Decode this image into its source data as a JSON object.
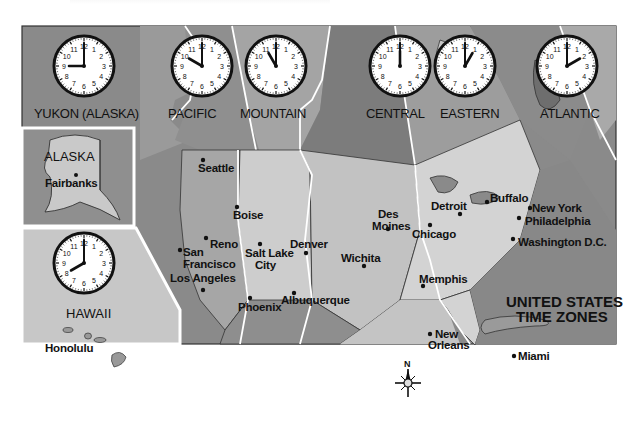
{
  "map": {
    "title_line1": "UNITED STATES",
    "title_line2": "TIME ZONES",
    "compass_label": "N",
    "colors": {
      "frame": "#333333",
      "ocean_dark": "#8a8a8a",
      "zone_dark": "#7c7c7c",
      "zone_mid": "#9e9e9e",
      "land_light": "#c9c9c9",
      "land_lighter": "#d9d9d9",
      "gulf": "#c4c4c4",
      "boundary": "#ffffff",
      "clock_face": "#ffffff",
      "clock_rim": "#111111"
    }
  },
  "clocks": [
    {
      "zone": "YUKON (ALASKA)",
      "time": "9:00",
      "hour": 9,
      "minute": 0
    },
    {
      "zone": "PACIFIC",
      "time": "10:00",
      "hour": 10,
      "minute": 0
    },
    {
      "zone": "MOUNTAIN",
      "time": "11:00",
      "hour": 11,
      "minute": 0
    },
    {
      "zone": "CENTRAL",
      "time": "12:00",
      "hour": 12,
      "minute": 0
    },
    {
      "zone": "EASTERN",
      "time": "1:00",
      "hour": 1,
      "minute": 0
    },
    {
      "zone": "ATLANTIC",
      "time": "2:00",
      "hour": 2,
      "minute": 0
    }
  ],
  "insets": {
    "alaska": {
      "label": "ALASKA",
      "city": "Fairbanks"
    },
    "hawaii": {
      "label": "HAWAII",
      "city": "Honolulu",
      "clock": {
        "time": "8:00",
        "hour": 8,
        "minute": 0
      }
    }
  },
  "cities": [
    {
      "name": "Seattle"
    },
    {
      "name": "Boise"
    },
    {
      "name": "Reno"
    },
    {
      "name": "San Francisco",
      "line1": "San",
      "line2": "Francisco"
    },
    {
      "name": "Los Angeles"
    },
    {
      "name": "Salt Lake City",
      "line1": "Salt Lake",
      "line2": "City"
    },
    {
      "name": "Denver"
    },
    {
      "name": "Phoenix"
    },
    {
      "name": "Albuquerque"
    },
    {
      "name": "Wichita"
    },
    {
      "name": "Des Moines",
      "line1": "Des",
      "line2": "Moines"
    },
    {
      "name": "Chicago"
    },
    {
      "name": "Detroit"
    },
    {
      "name": "Buffalo"
    },
    {
      "name": "New York"
    },
    {
      "name": "Philadelphia"
    },
    {
      "name": "Washington D.C."
    },
    {
      "name": "Memphis"
    },
    {
      "name": "New Orleans",
      "line1": "New",
      "line2": "Orleans"
    },
    {
      "name": "Miami"
    }
  ]
}
